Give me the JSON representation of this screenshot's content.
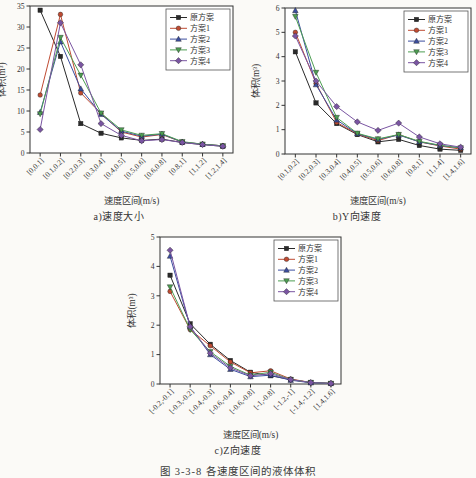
{
  "figure": {
    "caption": "图 3-3-8  各速度区间的液体体积"
  },
  "chart_data": [
    {
      "type": "line",
      "subtitle": "a)速度大小",
      "xlabel": "速度区间(m/s)",
      "ylabel": "体积(m³)",
      "ylim": [
        0,
        35
      ],
      "yticks": [
        0,
        5,
        10,
        15,
        20,
        25,
        30,
        35
      ],
      "grid": false,
      "legend_position": "top-right",
      "categories": [
        "[0,0.1]",
        "[0.1,0.2]",
        "[0.2,0.3]",
        "[0.3,0.4]",
        "[0.4,0.5]",
        "[0.5,0.6]",
        "[0.6,0.8]",
        "[0.8,1]",
        "[1,1.2]",
        "[1.2,1.4]"
      ],
      "series": [
        {
          "name": "原方案",
          "marker": "square",
          "color": "#2a2a2a",
          "values": [
            34,
            23,
            7,
            4.7,
            3.6,
            3.0,
            3.3,
            2.5,
            2.0,
            1.6
          ]
        },
        {
          "name": "方案1",
          "marker": "circle",
          "color": "#bf4b32",
          "values": [
            13.8,
            33,
            14.3,
            9.4,
            5.0,
            3.8,
            4.4,
            2.6,
            2.1,
            1.7
          ]
        },
        {
          "name": "方案2",
          "marker": "triangle-up",
          "color": "#3c4e9f",
          "values": [
            9.7,
            26.5,
            15.3,
            9.2,
            5.2,
            4.0,
            4.5,
            2.6,
            2.1,
            1.7
          ]
        },
        {
          "name": "方案3",
          "marker": "triangle-down",
          "color": "#4d9e52",
          "values": [
            9.3,
            27.5,
            18.5,
            9.5,
            5.5,
            4.2,
            4.6,
            2.7,
            2.1,
            1.7
          ]
        },
        {
          "name": "方案4",
          "marker": "diamond",
          "color": "#7a55a2",
          "values": [
            5.6,
            31,
            21,
            7.0,
            4.2,
            2.9,
            3.2,
            2.5,
            2.0,
            1.6
          ]
        }
      ]
    },
    {
      "type": "line",
      "subtitle": "b)Y向速度",
      "xlabel": "速度区间(m/s)",
      "ylabel": "体积(m³)",
      "ylim": [
        0,
        6
      ],
      "yticks": [
        0,
        1,
        2,
        3,
        4,
        5,
        6
      ],
      "grid": false,
      "legend_position": "top-right",
      "categories": [
        "[0.1,0.2]",
        "[0.2,0.3]",
        "[0.3,0.4]",
        "[0.4,0.5]",
        "[0.5,0.6]",
        "[0.6,0.8]",
        "[0.8,1]",
        "[1,1.4]",
        "[1.4,1.6]"
      ],
      "series": [
        {
          "name": "原方案",
          "marker": "square",
          "color": "#2a2a2a",
          "values": [
            4.2,
            2.1,
            1.25,
            0.8,
            0.5,
            0.6,
            0.35,
            0.2,
            0.15
          ]
        },
        {
          "name": "方案1",
          "marker": "circle",
          "color": "#bf4b32",
          "values": [
            5.0,
            2.9,
            1.3,
            0.82,
            0.55,
            0.8,
            0.5,
            0.33,
            0.2
          ]
        },
        {
          "name": "方案2",
          "marker": "triangle-up",
          "color": "#3c4e9f",
          "values": [
            5.9,
            2.85,
            1.4,
            0.83,
            0.6,
            0.78,
            0.5,
            0.35,
            0.25
          ]
        },
        {
          "name": "方案3",
          "marker": "triangle-down",
          "color": "#4d9e52",
          "values": [
            5.65,
            3.35,
            1.5,
            0.85,
            0.62,
            0.8,
            0.52,
            0.36,
            0.25
          ]
        },
        {
          "name": "方案4",
          "marker": "diamond",
          "color": "#7a55a2",
          "values": [
            4.85,
            3.0,
            1.95,
            1.32,
            0.97,
            1.27,
            0.7,
            0.42,
            0.28
          ]
        }
      ]
    },
    {
      "type": "line",
      "subtitle": "c)Z向速度",
      "xlabel": "速度区间(m/s)",
      "ylabel": "体积(m³)",
      "ylim": [
        0,
        5
      ],
      "yticks": [
        0,
        1,
        2,
        3,
        4,
        5
      ],
      "grid": false,
      "legend_position": "top-right",
      "categories": [
        "[-0.2,-0.1]",
        "[-0.3,-0.2]",
        "[-0.4,-0.3]",
        "[-0.6,-0.4]",
        "[-0.6,-0.8]",
        "[-1,-0.8]",
        "[-1.2,-1]",
        "[-1.4,-1.2]",
        "[1.4,1.6]"
      ],
      "series": [
        {
          "name": "原方案",
          "marker": "square",
          "color": "#2a2a2a",
          "values": [
            3.7,
            2.05,
            1.35,
            0.8,
            0.4,
            0.28,
            0.15,
            0.05,
            0.02
          ]
        },
        {
          "name": "方案1",
          "marker": "circle",
          "color": "#bf4b32",
          "values": [
            3.15,
            1.85,
            1.3,
            0.75,
            0.38,
            0.45,
            0.17,
            0.05,
            0.02
          ]
        },
        {
          "name": "方案2",
          "marker": "triangle-up",
          "color": "#3c4e9f",
          "values": [
            4.35,
            1.95,
            1.0,
            0.5,
            0.25,
            0.3,
            0.13,
            0.04,
            0.02
          ]
        },
        {
          "name": "方案3",
          "marker": "triangle-down",
          "color": "#4d9e52",
          "values": [
            3.3,
            1.85,
            1.1,
            0.6,
            0.3,
            0.4,
            0.15,
            0.05,
            0.02
          ]
        },
        {
          "name": "方案4",
          "marker": "diamond",
          "color": "#7a55a2",
          "values": [
            4.55,
            1.95,
            1.05,
            0.55,
            0.28,
            0.35,
            0.15,
            0.05,
            0.02
          ]
        }
      ]
    }
  ]
}
